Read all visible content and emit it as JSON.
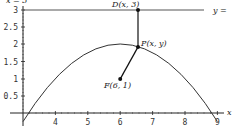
{
  "diagram": {
    "type": "parabola-focus-directrix",
    "top_label": "x = 3",
    "directrix_label": "y =",
    "points": {
      "D": {
        "label": "D(x, 3)",
        "x": 6.55,
        "y": 3
      },
      "P": {
        "label": "P(x, y)",
        "x": 6.55,
        "y": 1.92
      },
      "F": {
        "label": "F(6, 1)",
        "x": 6,
        "y": 1
      }
    },
    "axis": {
      "x_label": "x",
      "x_ticks": [
        "4",
        "5",
        "6",
        "7",
        "8",
        "9"
      ],
      "y_ticks": [
        "3",
        "2.5",
        "2",
        "1.5",
        "1",
        "0.5"
      ]
    },
    "curve": "y = 2 - (x-6)^2/4",
    "colors": {
      "line": "#222222",
      "curve": "#333333",
      "directrix": "#555555"
    }
  }
}
